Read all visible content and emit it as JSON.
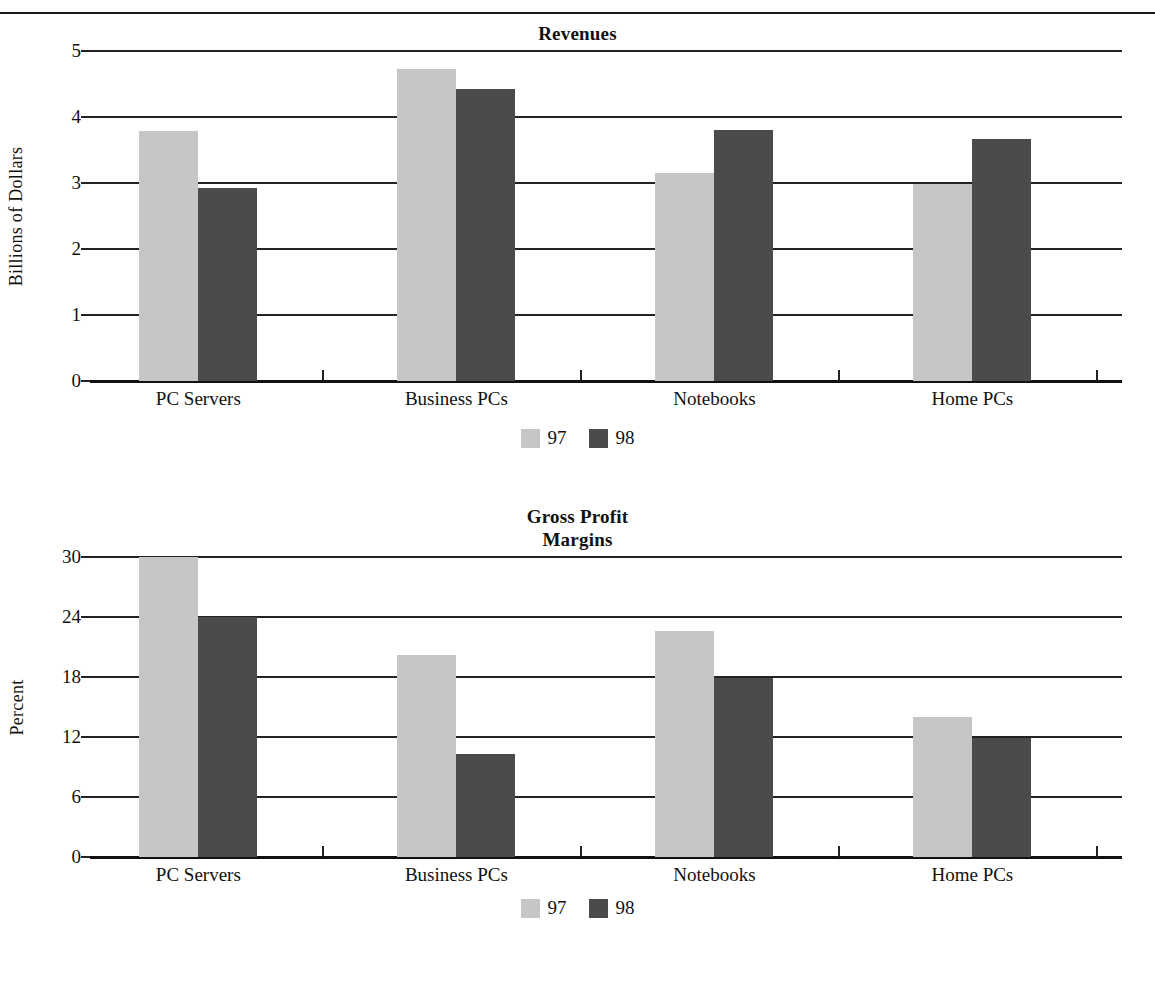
{
  "page": {
    "background": "#ffffff",
    "rule_color": "#1a1a1a"
  },
  "series_colors": {
    "s97": "#c6c6c6",
    "s98": "#4b4b4b"
  },
  "chart_data": [
    {
      "type": "bar",
      "title": "Revenues",
      "title_line2": "",
      "xlabel": "",
      "ylabel": "Billions of Dollars",
      "categories": [
        "PC Servers",
        "Business PCs",
        "Notebooks",
        "Home PCs"
      ],
      "series": [
        {
          "name": "97",
          "values": [
            3.79,
            4.72,
            3.15,
            2.98
          ]
        },
        {
          "name": "98",
          "values": [
            2.93,
            4.43,
            3.8,
            3.67
          ]
        }
      ],
      "ylim": [
        0,
        5
      ],
      "yticks": [
        0,
        1,
        2,
        3,
        4,
        5
      ],
      "ytick_labels": [
        "0",
        "1",
        "2",
        "3",
        "4",
        "5"
      ],
      "grid": true,
      "legend": [
        "97",
        "98"
      ],
      "legend_position": "bottom-center"
    },
    {
      "type": "bar",
      "title": "Gross Profit",
      "title_line2": "Margins",
      "xlabel": "",
      "ylabel": "Percent",
      "categories": [
        "PC Servers",
        "Business PCs",
        "Notebooks",
        "Home PCs"
      ],
      "series": [
        {
          "name": "97",
          "values": [
            30.0,
            20.2,
            22.6,
            14.0
          ]
        },
        {
          "name": "98",
          "values": [
            24.0,
            10.3,
            17.9,
            11.9
          ]
        }
      ],
      "ylim": [
        0,
        30
      ],
      "yticks": [
        0,
        6,
        12,
        18,
        24,
        30
      ],
      "ytick_labels": [
        "0",
        "6",
        "12",
        "18",
        "24",
        "30"
      ],
      "grid": true,
      "legend": [
        "97",
        "98"
      ],
      "legend_position": "bottom-center"
    }
  ]
}
